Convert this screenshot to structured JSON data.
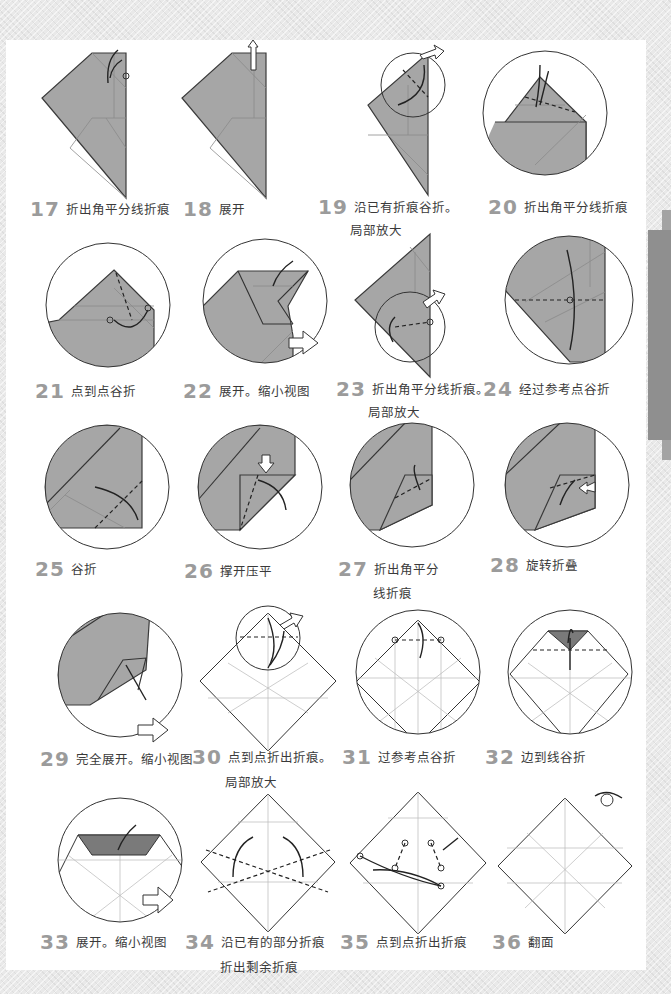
{
  "steps": [
    {
      "num": "17",
      "text": "折出角平分线折痕"
    },
    {
      "num": "18",
      "text": "展开"
    },
    {
      "num": "19",
      "text": "沿已有折痕谷折。",
      "sub": "局部放大"
    },
    {
      "num": "20",
      "text": "折出角平分线折痕"
    },
    {
      "num": "21",
      "text": "点到点谷折"
    },
    {
      "num": "22",
      "text": "展开。缩小视图"
    },
    {
      "num": "23",
      "text": "折出角平分线折痕。",
      "sub": "局部放大"
    },
    {
      "num": "24",
      "text": "经过参考点谷折"
    },
    {
      "num": "25",
      "text": "谷折"
    },
    {
      "num": "26",
      "text": "撑开压平"
    },
    {
      "num": "27",
      "text": "折出角平分",
      "sub": "线折痕"
    },
    {
      "num": "28",
      "text": "旋转折叠"
    },
    {
      "num": "29",
      "text": "完全展开。缩小视图"
    },
    {
      "num": "30",
      "text": "点到点折出折痕。",
      "sub": "局部放大"
    },
    {
      "num": "31",
      "text": "过参考点谷折"
    },
    {
      "num": "32",
      "text": "边到线谷折"
    },
    {
      "num": "33",
      "text": "展开。缩小视图"
    },
    {
      "num": "34",
      "text": "沿已有的部分折痕",
      "sub": "折出剩余折痕"
    },
    {
      "num": "35",
      "text": "点到点折出折痕"
    },
    {
      "num": "36",
      "text": "翻面"
    }
  ],
  "colors": {
    "paper": "#a6a6a6",
    "page": "#ffffff",
    "background": "#e9e9e9",
    "side_tab": "#8f8f8f",
    "step_number": "#9b9b9b"
  }
}
